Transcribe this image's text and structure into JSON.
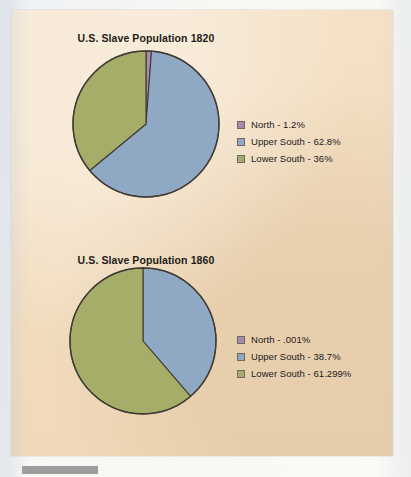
{
  "document": {
    "background_color": "#f4dfc2",
    "surround_color": "#f2f3f2",
    "caption_bar_color": "#9d9d9d"
  },
  "palette": {
    "north": "#a98aad",
    "upper_south": "#8fa9c4",
    "lower_south": "#a5ad69",
    "outline": "#413b33",
    "text": "#20201c"
  },
  "figures": [
    {
      "id": "1820",
      "title": "U.S. Slave Population 1820",
      "legend": [
        {
          "label": "North - 1.2%",
          "color_key": "north"
        },
        {
          "label": "Upper South - 62.8%",
          "color_key": "upper_south"
        },
        {
          "label": "Lower South - 36%",
          "color_key": "lower_south"
        }
      ]
    },
    {
      "id": "1860",
      "title": "U.S. Slave Population 1860",
      "legend": [
        {
          "label": "North - .001%",
          "color_key": "north"
        },
        {
          "label": "Upper South - 38.7%",
          "color_key": "upper_south"
        },
        {
          "label": "Lower South - 61.299%",
          "color_key": "lower_south"
        }
      ]
    }
  ],
  "chart_data": [
    {
      "type": "pie",
      "title": "U.S. Slave Population 1820",
      "labels": [
        "North",
        "Upper South",
        "Lower South"
      ],
      "values": [
        1.2,
        62.8,
        36
      ],
      "value_labels": [
        "1.2%",
        "62.8%",
        "36%"
      ],
      "colors": [
        "#a98aad",
        "#8fa9c4",
        "#a5ad69"
      ],
      "units": "percent",
      "start_angle_deg": 0,
      "direction": "clockwise",
      "legend_position": "right",
      "grid": false
    },
    {
      "type": "pie",
      "title": "U.S. Slave Population 1860",
      "labels": [
        "North",
        "Upper South",
        "Lower South"
      ],
      "values": [
        0.001,
        38.7,
        61.299
      ],
      "value_labels": [
        ".001%",
        "38.7%",
        "61.299%"
      ],
      "colors": [
        "#a98aad",
        "#8fa9c4",
        "#a5ad69"
      ],
      "units": "percent",
      "start_angle_deg": 0,
      "direction": "clockwise",
      "legend_position": "right",
      "grid": false
    }
  ]
}
